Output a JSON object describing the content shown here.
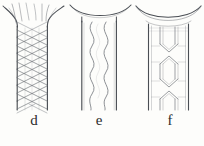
{
  "figure": {
    "background_color": "#fdfdfb",
    "ink_color": "#6b6f75",
    "ink_color_dark": "#4a4e54",
    "label_color": "#2b2b2b",
    "panels": [
      {
        "id": "d",
        "label": "d",
        "pattern_name": "dense-braided-crosshatch",
        "description": "Flared-top tube filled with dense diagonal criss-cross braided mesh",
        "tube": {
          "left_wall_x": 17,
          "right_wall_x": 47,
          "top_y": 26,
          "bottom_y": 110,
          "flare_top_y": 8,
          "flare_half_width": 32
        },
        "mesh": {
          "rows": 11,
          "columns": 4,
          "strand_angle_deg": 52,
          "strand_count": 22
        }
      },
      {
        "id": "e",
        "label": "e",
        "pattern_name": "double-sinusoidal-wave",
        "description": "Flared-top tube with two vertical sinusoidal wire lines inside",
        "tube": {
          "left_wall_x": 14,
          "right_wall_x": 48,
          "top_y": 22,
          "bottom_y": 110,
          "flare_top_y": 7,
          "flare_half_width": 31
        },
        "waves": {
          "count": 2,
          "cycles": 4,
          "amplitude": 9
        }
      },
      {
        "id": "f",
        "label": "f",
        "pattern_name": "bowtie-x-cell-struts",
        "description": "Flared-top tube with outlined struts forming two X / bow-tie cells",
        "tube": {
          "left_wall_x": 15,
          "right_wall_x": 53,
          "top_y": 24,
          "bottom_y": 110,
          "flare_top_y": 7,
          "flare_half_width": 33
        },
        "cells": {
          "count": 2,
          "centers_y": [
            54,
            89
          ],
          "strut_outline": true
        }
      }
    ]
  }
}
